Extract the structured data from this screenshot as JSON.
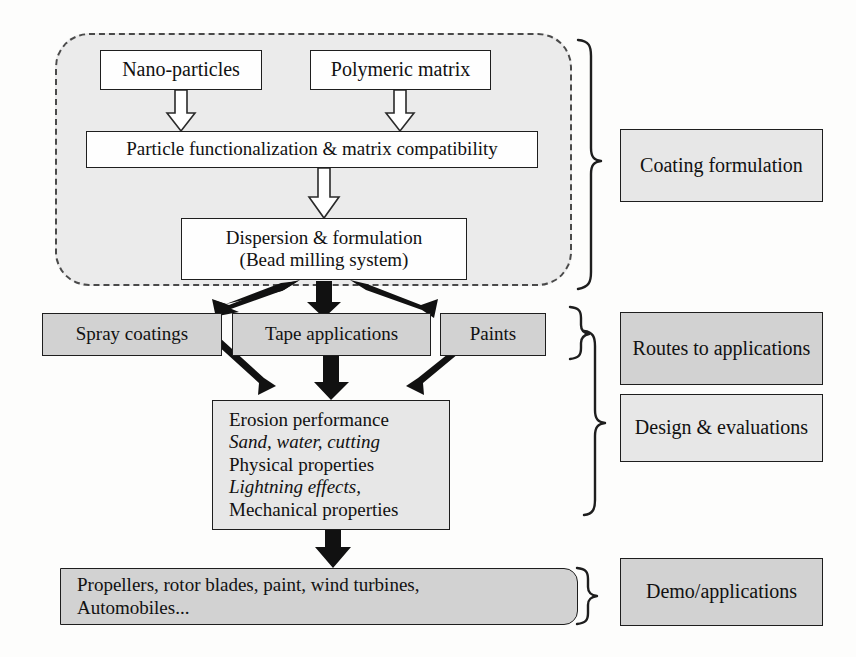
{
  "diagram": {
    "colors": {
      "group_fill": "#ebebeb",
      "box_white": "#fefefe",
      "box_gray": "#d2d2d2",
      "box_lightgray": "#e7e7e7",
      "stroke": "#1e1e1e",
      "dashed_stroke": "#4a4a4a",
      "arrow_hollow_fill": "#ffffff",
      "arrow_solid_fill": "#111111",
      "background": "#fdfdfc"
    },
    "stage1": {
      "nano_particles": "Nano-particles",
      "polymeric_matrix": "Polymeric matrix",
      "functionalization": "Particle functionalization & matrix compatibility",
      "dispersion_line1": "Dispersion & formulation",
      "dispersion_line2": "(Bead milling system)"
    },
    "stage2": {
      "spray_coatings": "Spray coatings",
      "tape_applications": "Tape applications",
      "paints": "Paints"
    },
    "stage3": {
      "line1": "Erosion performance",
      "line2": "Sand, water, cutting",
      "line3": "Physical properties",
      "line4": "Lightning effects,",
      "line5": "Mechanical properties"
    },
    "stage4": {
      "line1": "Propellers, rotor blades, paint, wind turbines,",
      "line2": "Automobiles..."
    },
    "right_labels": {
      "coating_formulation": "Coating formulation",
      "routes_to_applications": "Routes to applications",
      "design_and_evaluations": "Design & evaluations",
      "demo_applications": "Demo/applications"
    }
  }
}
